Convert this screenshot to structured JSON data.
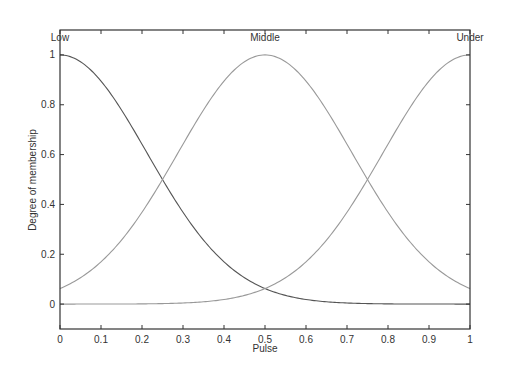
{
  "chart_data": {
    "type": "line",
    "title": "",
    "xlabel": "Pulse",
    "ylabel": "Degree of membership",
    "xlim": [
      0,
      1
    ],
    "ylim": [
      -0.1,
      1.1
    ],
    "grid": false,
    "legend": "none",
    "x_ticks": [
      "0",
      "0.1",
      "0.2",
      "0.3",
      "0.4",
      "0.5",
      "0.6",
      "0.7",
      "0.8",
      "0.9",
      "1"
    ],
    "y_ticks": [
      "0",
      "0.2",
      "0.4",
      "0.6",
      "0.8",
      "1"
    ],
    "x": [
      0,
      0.05,
      0.1,
      0.15,
      0.2,
      0.25,
      0.3,
      0.35,
      0.4,
      0.45,
      0.5,
      0.55,
      0.6,
      0.65,
      0.7,
      0.75,
      0.8,
      0.85,
      0.9,
      0.95,
      1
    ],
    "series": [
      {
        "name": "Low",
        "function": "gaussmf",
        "sigma": 0.2123,
        "center": 0,
        "values": [
          1.0,
          0.973,
          0.895,
          0.779,
          0.642,
          0.5,
          0.369,
          0.257,
          0.17,
          0.106,
          0.0625,
          0.035,
          0.0185,
          0.0092,
          0.0043,
          0.002,
          0.0008,
          0.0003,
          0.0001,
          0.0,
          0.0
        ]
      },
      {
        "name": "Middle",
        "function": "gaussmf",
        "sigma": 0.2123,
        "center": 0.5,
        "values": [
          0.0625,
          0.106,
          0.17,
          0.257,
          0.369,
          0.5,
          0.642,
          0.779,
          0.895,
          0.973,
          1.0,
          0.973,
          0.895,
          0.779,
          0.642,
          0.5,
          0.369,
          0.257,
          0.17,
          0.106,
          0.0625
        ]
      },
      {
        "name": "Under",
        "function": "gaussmf",
        "sigma": 0.2123,
        "center": 1,
        "values": [
          0.0,
          0.0,
          0.0001,
          0.0003,
          0.0008,
          0.002,
          0.0043,
          0.0092,
          0.0185,
          0.035,
          0.0625,
          0.106,
          0.17,
          0.257,
          0.369,
          0.5,
          0.642,
          0.779,
          0.895,
          0.973,
          1.0
        ]
      }
    ],
    "annotations": [
      {
        "text": "Low",
        "x": 0,
        "y": 1.07
      },
      {
        "text": "Middle",
        "x": 0.5,
        "y": 1.07
      },
      {
        "text": "Under",
        "x": 1,
        "y": 1.07
      }
    ]
  }
}
